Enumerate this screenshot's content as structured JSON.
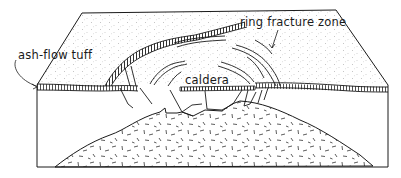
{
  "diagram": {
    "type": "block-diagram",
    "labels": {
      "ash_flow_tuff": "ash-flow tuff",
      "caldera": "caldera",
      "ring_fracture_zone": "ring fracture zone"
    },
    "colors": {
      "line": "#1a1a1a",
      "background": "#ffffff",
      "stipple": "#8a8a8a"
    }
  }
}
